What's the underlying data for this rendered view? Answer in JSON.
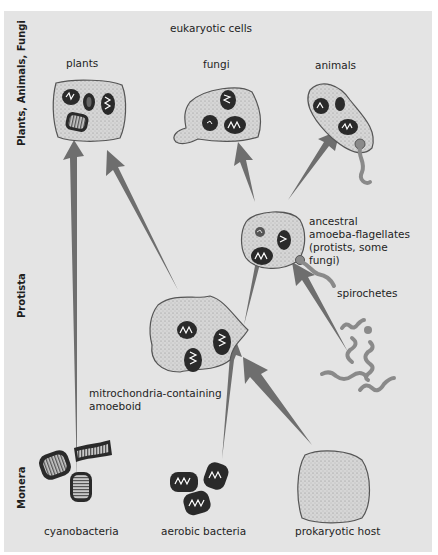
{
  "diagram": {
    "title": "eukaryotic cells",
    "kingdom_labels": {
      "top": "Plants, Animals, Fungi",
      "middle": "Protista",
      "bottom": "Monera"
    },
    "organisms": {
      "plants": "plants",
      "fungi": "fungi",
      "animals": "animals",
      "ancestral_line1": "ancestral",
      "ancestral_line2": "amoeba-flagellates",
      "ancestral_line3": "(protists, some",
      "ancestral_line4": "fungi)",
      "spirochetes": "spirochetes",
      "amoeboid_line1": "mitrochondria-containing",
      "amoeboid_line2": "amoeboid",
      "cyanobacteria": "cyanobacteria",
      "aerobic_bacteria": "aerobic bacteria",
      "prokaryotic_host": "prokaryotic host"
    },
    "colors": {
      "background": "#e4e4e4",
      "arrow": "#6e6e6e",
      "cell_fill": "#d2d2d2",
      "organelle": "#2a2a2a"
    },
    "relationships": [
      {
        "from": "cyanobacteria",
        "to": "plants"
      },
      {
        "from": "aerobic bacteria",
        "to": "mitrochondria-containing amoeboid"
      },
      {
        "from": "prokaryotic host",
        "to": "mitrochondria-containing amoeboid"
      },
      {
        "from": "mitrochondria-containing amoeboid",
        "to": "plants"
      },
      {
        "from": "mitrochondria-containing amoeboid",
        "to": "ancestral amoeba-flagellates"
      },
      {
        "from": "spirochetes",
        "to": "ancestral amoeba-flagellates"
      },
      {
        "from": "ancestral amoeba-flagellates",
        "to": "fungi"
      },
      {
        "from": "ancestral amoeba-flagellates",
        "to": "animals"
      }
    ]
  }
}
